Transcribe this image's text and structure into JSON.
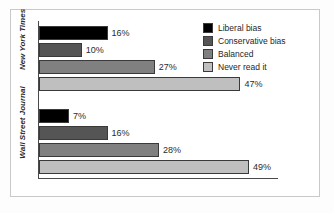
{
  "chart_data": {
    "type": "bar",
    "orientation": "horizontal",
    "title": "",
    "xlabel": "",
    "ylabel": "",
    "categories": [
      "New York Times",
      "Wall Street Journal"
    ],
    "series": [
      {
        "name": "Liberal bias",
        "color": "#000000",
        "values": [
          16,
          7
        ]
      },
      {
        "name": "Conservative bias",
        "color": "#555555",
        "values": [
          10,
          16
        ]
      },
      {
        "name": "Balanced",
        "color": "#808080",
        "values": [
          27,
          28
        ]
      },
      {
        "name": "Never read it",
        "color": "#bfbfbf",
        "values": [
          47,
          49
        ]
      }
    ],
    "value_labels": [
      [
        "16%",
        "10%",
        "27%",
        "47%"
      ],
      [
        "7%",
        "16%",
        "28%",
        "49%"
      ]
    ],
    "xlim": [
      0,
      56
    ],
    "grid": false,
    "legend_position": "top-right"
  },
  "legend": {
    "items": [
      {
        "label": "Liberal bias",
        "color": "#000000"
      },
      {
        "label": "Conservative bias",
        "color": "#555555"
      },
      {
        "label": "Balanced",
        "color": "#808080"
      },
      {
        "label": "Never read it",
        "color": "#bfbfbf"
      }
    ]
  },
  "axes": {
    "category_labels": [
      "New York Times",
      "Wall Street Journal"
    ]
  }
}
